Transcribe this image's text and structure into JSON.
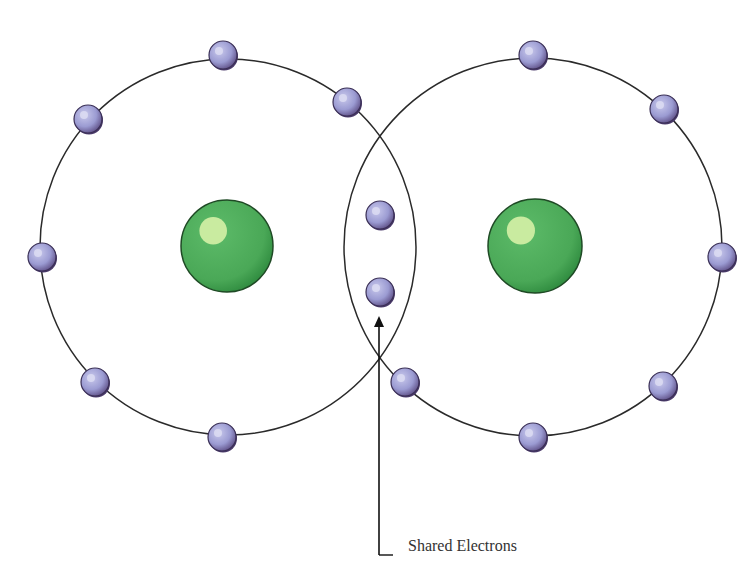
{
  "diagram": {
    "label": "Shared Electrons",
    "colors": {
      "orbit": "#2a2a2a",
      "nucleus": "#4fae5c",
      "nucleus_dark": "#2e8a3e",
      "nucleus_highlight": "#c9eba0",
      "electron": "#9a9ad0",
      "electron_dark": "#4a3a6a",
      "electron_highlight": "#dcdcf2"
    },
    "atoms": [
      {
        "orbit": {
          "cx": 228,
          "cy": 247,
          "r": 188
        },
        "nucleus": {
          "cx": 227,
          "cy": 246,
          "r": 46
        }
      },
      {
        "orbit": {
          "cx": 533,
          "cy": 247,
          "r": 189
        },
        "nucleus": {
          "cx": 535,
          "cy": 246,
          "r": 47
        }
      }
    ],
    "electrons": [
      {
        "x": 223,
        "y": 55
      },
      {
        "x": 347,
        "y": 102
      },
      {
        "x": 88,
        "y": 119
      },
      {
        "x": 42,
        "y": 257
      },
      {
        "x": 95,
        "y": 382
      },
      {
        "x": 222,
        "y": 437
      },
      {
        "x": 380,
        "y": 215
      },
      {
        "x": 380,
        "y": 292
      },
      {
        "x": 405,
        "y": 382
      },
      {
        "x": 533,
        "y": 437
      },
      {
        "x": 663,
        "y": 386
      },
      {
        "x": 722,
        "y": 257
      },
      {
        "x": 664,
        "y": 109
      },
      {
        "x": 533,
        "y": 55
      }
    ],
    "pointer": {
      "x": 379,
      "y_top": 316,
      "y_bottom": 555,
      "x_end": 393
    }
  }
}
